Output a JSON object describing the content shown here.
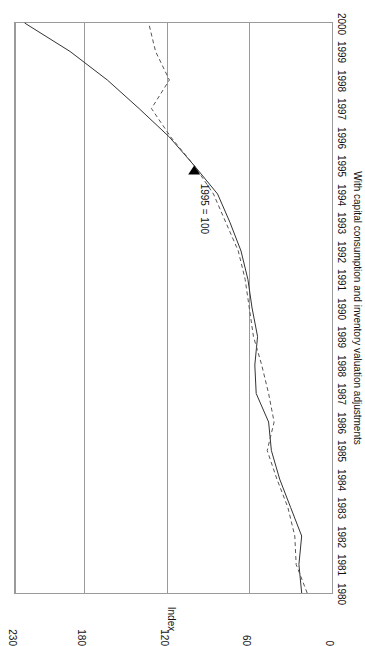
{
  "chart_data": {
    "type": "line",
    "title": "",
    "subtitle": "With capital consumption and inventory valuation adjustments",
    "xlabel": "",
    "ylabel": "Index",
    "annotation": "1995 = 100",
    "grid": true,
    "legend_position": "none",
    "xlim": [
      1980,
      2000
    ],
    "ylim": [
      0,
      230
    ],
    "yticks": [
      0,
      60,
      120,
      180,
      230
    ],
    "ytick_labels": [
      "0",
      "60",
      "120",
      "180",
      "230"
    ],
    "x": [
      1980,
      1981,
      1982,
      1983,
      1984,
      1985,
      1986,
      1987,
      1988,
      1989,
      1990,
      1991,
      1992,
      1993,
      1994,
      1995,
      1996,
      1997,
      1998,
      1999,
      2000
    ],
    "categories": [
      "1980",
      "1981",
      "1982",
      "1983",
      "1984",
      "1985",
      "1986",
      "1987",
      "1988",
      "1989",
      "1990",
      "1991",
      "1992",
      "1993",
      "1994",
      "1995",
      "1996",
      "1997",
      "1998",
      "1999",
      "2000"
    ],
    "series": [
      {
        "name": "solid-series",
        "style": "solid",
        "color": "#333333",
        "values": [
          22,
          24,
          22,
          30,
          38,
          44,
          46,
          55,
          56,
          54,
          58,
          61,
          66,
          74,
          83,
          100,
          118,
          140,
          163,
          190,
          223
        ]
      },
      {
        "name": "dashed-series",
        "style": "dashed",
        "color": "#555555",
        "values": [
          18,
          26,
          27,
          32,
          40,
          47,
          42,
          46,
          51,
          57,
          60,
          63,
          68,
          77,
          86,
          100,
          117,
          131,
          118,
          128,
          133
        ]
      }
    ],
    "marker": {
      "label": "1995 = 100",
      "x": 1995,
      "y": 100,
      "shape": "triangle",
      "color": "#000000"
    },
    "colors": {
      "axis": "#9a9a9a",
      "text": "#111111",
      "background": "#ffffff"
    }
  }
}
